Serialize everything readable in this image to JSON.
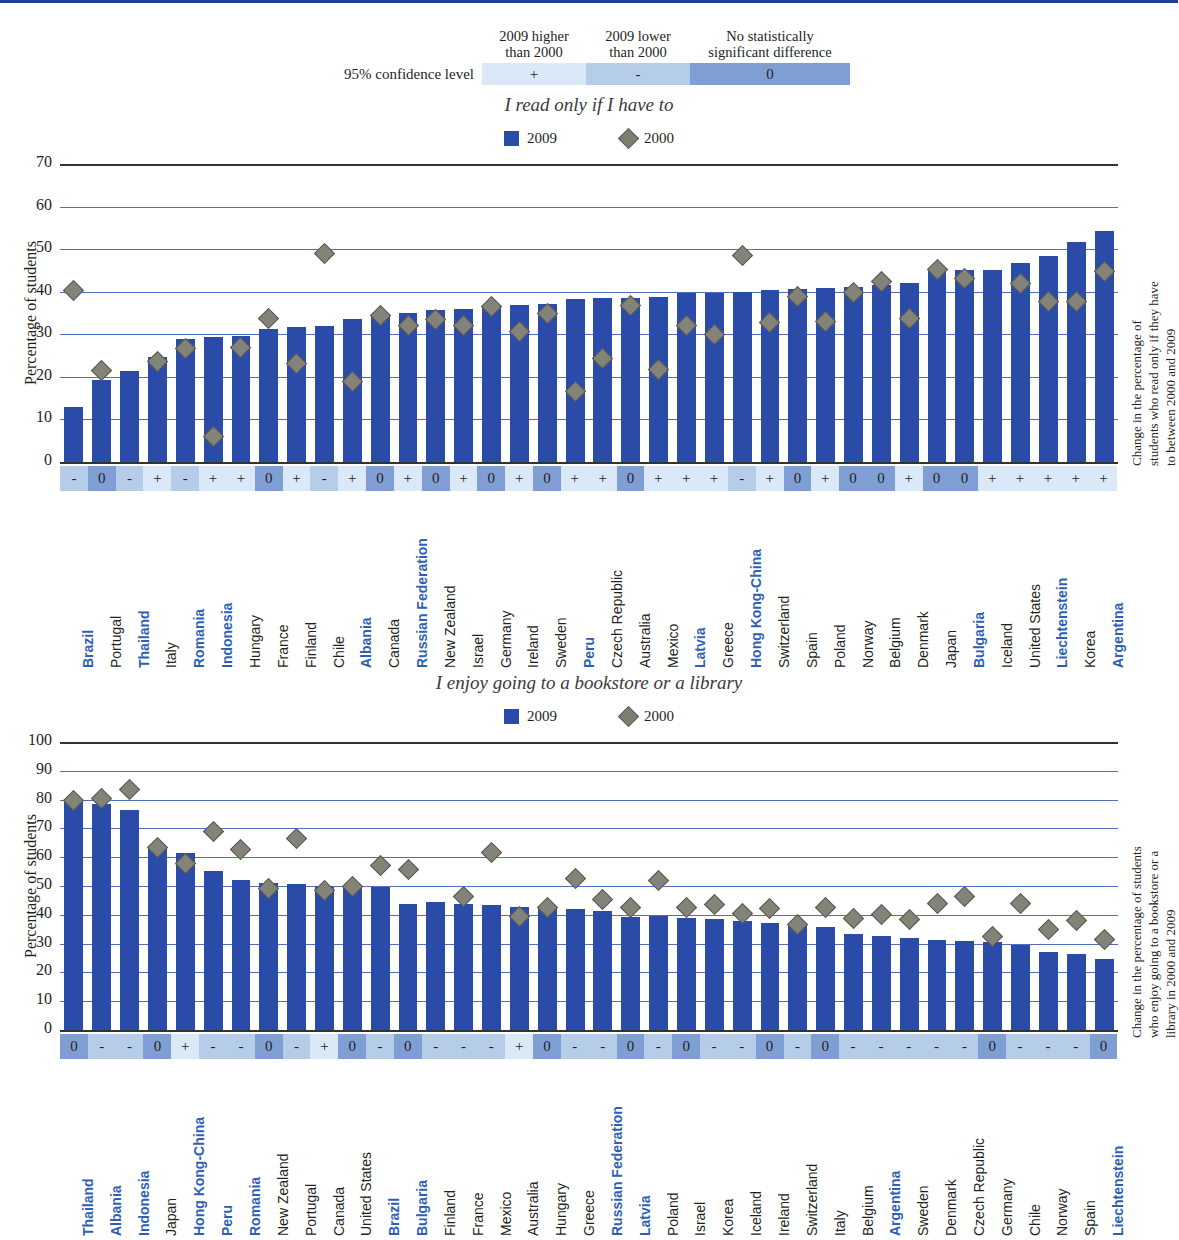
{
  "key": {
    "row_label": "95% confidence level",
    "headers": [
      "2009 higher\nthan 2000",
      "2009 lower\nthan 2000",
      "No statistically\nsignificant difference"
    ],
    "header1_line1": "2009 higher",
    "header1_line2": "than 2000",
    "header2_line1": "2009 lower",
    "header2_line2": "than 2000",
    "header3_line1": "No statistically",
    "header3_line2": "significant difference",
    "symbols": [
      "+",
      "-",
      "0"
    ],
    "colors": {
      "plus": "#dbe8f7",
      "minus": "#b5cde9",
      "zero": "#7f9fd4"
    }
  },
  "chart_data": [
    {
      "type": "bar",
      "title": "I read only if I have to",
      "ylabel": "Percentage of students",
      "right_label": "Change in the percentage of students who read only if they have to between 2000 and 2009",
      "right_label_l1": "Change in the percentage of",
      "right_label_l2": "students who read only if they have",
      "right_label_l3": "to between 2000 and 2009",
      "ylim": [
        0,
        70
      ],
      "yticks": [
        0,
        10,
        20,
        30,
        40,
        50,
        60,
        70
      ],
      "grid": true,
      "legend": [
        {
          "name": "2009",
          "marker": "bar"
        },
        {
          "name": "2000",
          "marker": "diamond"
        }
      ],
      "categories": [
        "Brazil",
        "Portugal",
        "Thailand",
        "Italy",
        "Romania",
        "Indonesia",
        "Hungary",
        "France",
        "Finland",
        "Chile",
        "Albania",
        "Canada",
        "Russian Federation",
        "New Zealand",
        "Israel",
        "Germany",
        "Ireland",
        "Sweden",
        "Peru",
        "Czech Republic",
        "Australia",
        "Mexico",
        "Latvia",
        "Greece",
        "Hong Kong-China",
        "Switzerland",
        "Spain",
        "Poland",
        "Norway",
        "Belgium",
        "Denmark",
        "Japan",
        "Bulgaria",
        "Iceland",
        "United States",
        "Liechtenstein",
        "Korea",
        "Argentina"
      ],
      "highlight": [
        "Brazil",
        "Thailand",
        "Romania",
        "Indonesia",
        "Albania",
        "Russian Federation",
        "Peru",
        "Latvia",
        "Hong Kong-China",
        "Bulgaria",
        "Liechtenstein",
        "Argentina"
      ],
      "series": [
        {
          "name": "2009",
          "values": [
            13.0,
            19.2,
            21.4,
            24.6,
            28.8,
            29.3,
            29.6,
            31.2,
            31.8,
            32.0,
            33.6,
            34.4,
            35.0,
            35.6,
            36.0,
            36.5,
            36.8,
            37.0,
            38.3,
            38.6,
            38.6,
            38.8,
            39.7,
            39.8,
            40.0,
            40.3,
            40.6,
            40.8,
            41.1,
            41.6,
            42.0,
            44.8,
            45.0,
            45.0,
            46.8,
            48.4,
            51.6,
            54.2
          ]
        },
        {
          "name": "2000",
          "values": [
            40.3,
            21.5,
            null,
            23.6,
            26.7,
            5.9,
            26.8,
            33.6,
            23.2,
            49.0,
            19.0,
            34.4,
            32.0,
            33.5,
            32.0,
            36.5,
            30.6,
            35.0,
            16.5,
            24.3,
            36.8,
            21.8,
            32.1,
            30.0,
            48.4,
            32.7,
            38.8,
            33.0,
            39.7,
            42.5,
            33.8,
            45.2,
            43.0,
            null,
            42.0,
            37.8,
            37.8,
            44.8
          ]
        }
      ],
      "significance": [
        "-",
        "0",
        "-",
        "+",
        "-",
        "+",
        "+",
        "0",
        "+",
        "-",
        "+",
        "0",
        "+",
        "0",
        "+",
        "0",
        "+",
        "0",
        "+",
        "+",
        "0",
        "+",
        "+",
        "+",
        "-",
        "+",
        "0",
        "+",
        "0",
        "0",
        "+",
        "0",
        "0",
        "+",
        "+",
        "+",
        "+",
        "+"
      ]
    },
    {
      "type": "bar",
      "title": "I enjoy going to a bookstore or a library",
      "ylabel": "Percentage of students",
      "right_label": "Change in the percentage of students who enjoy going to a bookstore or a library in 2000 and 2009",
      "right_label_l1": "Change in the percentage of students",
      "right_label_l2": "who enjoy going to a bookstore or a",
      "right_label_l3": "library in 2000 and 2009",
      "ylim": [
        0,
        100
      ],
      "yticks": [
        0,
        10,
        20,
        30,
        40,
        50,
        60,
        70,
        80,
        90,
        100
      ],
      "grid": true,
      "legend": [
        {
          "name": "2009",
          "marker": "bar"
        },
        {
          "name": "2000",
          "marker": "diamond"
        }
      ],
      "categories": [
        "Thailand",
        "Albania",
        "Indonesia",
        "Japan",
        "Hong Kong-China",
        "Peru",
        "Romania",
        "New Zealand",
        "Portugal",
        "Canada",
        "United States",
        "Brazil",
        "Bulgaria",
        "Finland",
        "France",
        "Mexico",
        "Australia",
        "Hungary",
        "Greece",
        "Russian Federation",
        "Latvia",
        "Poland",
        "Israel",
        "Korea",
        "Iceland",
        "Ireland",
        "Switzerland",
        "Italy",
        "Belgium",
        "Argentina",
        "Sweden",
        "Denmark",
        "Czech Republic",
        "Germany",
        "Chile",
        "Norway",
        "Spain",
        "Liechtenstein"
      ],
      "highlight": [
        "Thailand",
        "Albania",
        "Indonesia",
        "Hong Kong-China",
        "Peru",
        "Romania",
        "Brazil",
        "Bulgaria",
        "Russian Federation",
        "Latvia",
        "Argentina",
        "Liechtenstein"
      ],
      "series": [
        {
          "name": "2009",
          "values": [
            79.7,
            78.5,
            76.4,
            63.3,
            61.6,
            55.3,
            52.2,
            51.0,
            50.6,
            50.0,
            49.7,
            49.5,
            43.8,
            44.5,
            43.6,
            43.4,
            42.8,
            42.5,
            42.0,
            41.2,
            39.4,
            39.5,
            38.8,
            38.6,
            37.7,
            37.0,
            36.0,
            35.6,
            33.2,
            32.5,
            31.8,
            31.1,
            31.0,
            30.5,
            29.5,
            27.0,
            26.5,
            24.8
          ]
        },
        {
          "name": "2000",
          "values": [
            79.7,
            80.3,
            83.6,
            63.3,
            57.8,
            69.0,
            62.8,
            49.3,
            66.5,
            48.6,
            50.0,
            57.0,
            55.8,
            null,
            46.5,
            61.5,
            39.5,
            42.5,
            52.5,
            45.2,
            42.5,
            52.0,
            42.5,
            43.6,
            40.5,
            42.2,
            36.5,
            42.5,
            38.8,
            40.2,
            38.5,
            44.0,
            46.5,
            32.3,
            44.0,
            34.8,
            38.0,
            31.5
          ]
        }
      ],
      "significance": [
        "0",
        "-",
        "-",
        "0",
        "+",
        "-",
        "-",
        "0",
        "-",
        "+",
        "0",
        "-",
        "0",
        "-",
        "-",
        "-",
        "+",
        "0",
        "-",
        "-",
        "0",
        "-",
        "0",
        "-",
        "-",
        "0",
        "-",
        "0",
        "-",
        "-",
        "-",
        "-",
        "-",
        "0",
        "-",
        "-",
        "-",
        "0"
      ]
    }
  ]
}
